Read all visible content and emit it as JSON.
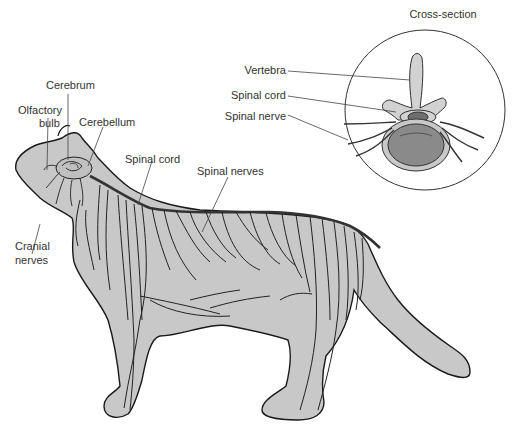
{
  "diagram": {
    "colors": {
      "body_fill": "#c8c8c8",
      "outline": "#1a1a1a",
      "nerve": "#222222",
      "spinal_cord": "#333333",
      "leader_line": "#444444",
      "disc_fill": "#8a8a8a",
      "cord_fill": "#6e6e6e",
      "background": "#ffffff"
    },
    "labels": {
      "cerebrum": "Cerebrum",
      "olfactory_bulb_1": "Olfactory",
      "olfactory_bulb_2": "bulb",
      "cerebellum": "Cerebellum",
      "spinal_cord": "Spinal cord",
      "spinal_nerves": "Spinal nerves",
      "cranial_nerves_1": "Cranial",
      "cranial_nerves_2": "nerves"
    },
    "inset": {
      "title": "Cross-section",
      "labels": {
        "vertebra": "Vertebra",
        "spinal_cord": "Spinal cord",
        "spinal_nerve": "Spinal nerve"
      }
    }
  }
}
